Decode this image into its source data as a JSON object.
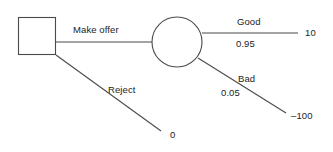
{
  "diagram": {
    "type": "decision-tree",
    "background_color": "#ffffff",
    "line_color": "#4a4a4a",
    "text_color": "#1c1c1c",
    "nodes": [
      {
        "id": "decision",
        "shape": "square",
        "role": "decision-node",
        "x": 18,
        "y": 17,
        "width": 38,
        "height": 38
      },
      {
        "id": "chance",
        "shape": "circle",
        "role": "chance-node",
        "cx": 177,
        "cy": 42,
        "r": 25
      }
    ],
    "branches": [
      {
        "id": "make-offer",
        "from": "decision",
        "to": "chance",
        "label": "Make offer",
        "probability": "",
        "payoff": ""
      },
      {
        "id": "reject",
        "from": "decision",
        "to": "terminal-reject",
        "label": "Reject",
        "probability": "",
        "payoff": "0"
      },
      {
        "id": "good",
        "from": "chance",
        "to": "terminal-good",
        "label": "Good",
        "probability": "0.95",
        "payoff": "10"
      },
      {
        "id": "bad",
        "from": "chance",
        "to": "terminal-bad",
        "label": "Bad",
        "probability": "0.05",
        "payoff": "–100"
      }
    ]
  }
}
